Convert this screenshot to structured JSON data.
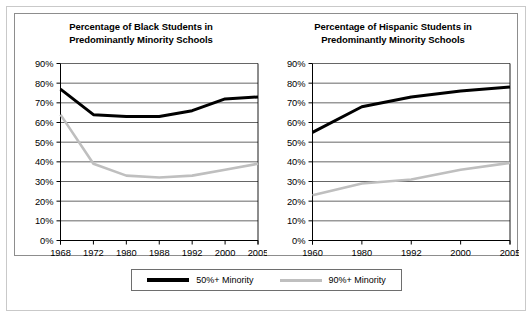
{
  "legend": {
    "entries": [
      {
        "label": "50%+ Minority",
        "icon": "black-line-swatch",
        "color": "#000000"
      },
      {
        "label": "90%+ Minority",
        "icon": "gray-line-swatch",
        "color": "#bfbfbf"
      }
    ]
  },
  "chart_data": [
    {
      "type": "line",
      "title": "Percentage of Black Students in Predominantly Minority Schools",
      "title_line1": "Percentage of Black Students in",
      "title_line2": "Predominantly Minority Schools",
      "xlabel": "",
      "ylabel": "",
      "categories": [
        "1968",
        "1972",
        "1980",
        "1988",
        "1992",
        "2000",
        "2005"
      ],
      "x": [
        1968,
        1972,
        1980,
        1988,
        1992,
        2000,
        2005
      ],
      "ylim": [
        0,
        90
      ],
      "yticks": [
        "0%",
        "10%",
        "20%",
        "30%",
        "40%",
        "50%",
        "60%",
        "70%",
        "80%",
        "90%"
      ],
      "ytick_values": [
        0,
        10,
        20,
        30,
        40,
        50,
        60,
        70,
        80,
        90
      ],
      "grid": true,
      "legend_position": "bottom-shared",
      "series": [
        {
          "name": "50%+ Minority",
          "color": "#000000",
          "values": [
            77,
            64,
            63,
            63,
            66,
            72,
            73
          ]
        },
        {
          "name": "90%+ Minority",
          "color": "#bfbfbf",
          "values": [
            64,
            39,
            33,
            32,
            33,
            36,
            39
          ]
        }
      ]
    },
    {
      "type": "line",
      "title": "Percentage of Hispanic Students in Predominantly Minority Schools",
      "title_line1": "Percentage of Hispanic Students in",
      "title_line2": "Predominantly Minority Schools",
      "xlabel": "",
      "ylabel": "",
      "categories": [
        "1960",
        "1980",
        "1992",
        "2000",
        "2005"
      ],
      "x": [
        1960,
        1980,
        1992,
        2000,
        2005
      ],
      "ylim": [
        0,
        90
      ],
      "yticks": [
        "0%",
        "10%",
        "20%",
        "30%",
        "40%",
        "50%",
        "60%",
        "70%",
        "80%",
        "90%"
      ],
      "ytick_values": [
        0,
        10,
        20,
        30,
        40,
        50,
        60,
        70,
        80,
        90
      ],
      "grid": true,
      "legend_position": "bottom-shared",
      "series": [
        {
          "name": "50%+ Minority",
          "color": "#000000",
          "values": [
            55,
            68,
            73,
            76,
            78
          ]
        },
        {
          "name": "90%+ Minority",
          "color": "#bfbfbf",
          "values": [
            23,
            29,
            31,
            36,
            39.5
          ]
        }
      ]
    }
  ]
}
